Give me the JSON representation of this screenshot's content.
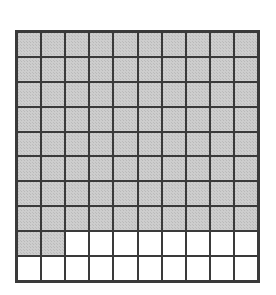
{
  "figure": {
    "description": "A ten by ten square grid with some cells shaded",
    "grid": {
      "rows": 10,
      "columns": 10,
      "total_cells": 100,
      "shaded_cells": 82,
      "unshaded_cells": 18,
      "shaded_fraction": "82/100",
      "shaded_decimal": "0.82",
      "shaded_percent": "82%"
    },
    "colors": {
      "shaded_fill": "#cdcdcd",
      "unshaded_fill": "#ffffff",
      "grid_line": "#3a3a3a",
      "background": "#ffffff"
    }
  },
  "chart_data": {
    "type": "heatmap",
    "xlabel": "",
    "ylabel": "",
    "categories": [
      "1",
      "2",
      "3",
      "4",
      "5",
      "6",
      "7",
      "8",
      "9",
      "10"
    ],
    "row_labels": [
      "1",
      "2",
      "3",
      "4",
      "5",
      "6",
      "7",
      "8",
      "9",
      "10"
    ],
    "legend": [
      "shaded",
      "unshaded"
    ],
    "value_map": {
      "1": "shaded",
      "0": "unshaded"
    },
    "values": [
      [
        1,
        1,
        1,
        1,
        1,
        1,
        1,
        1,
        1,
        1
      ],
      [
        1,
        1,
        1,
        1,
        1,
        1,
        1,
        1,
        1,
        1
      ],
      [
        1,
        1,
        1,
        1,
        1,
        1,
        1,
        1,
        1,
        1
      ],
      [
        1,
        1,
        1,
        1,
        1,
        1,
        1,
        1,
        1,
        1
      ],
      [
        1,
        1,
        1,
        1,
        1,
        1,
        1,
        1,
        1,
        1
      ],
      [
        1,
        1,
        1,
        1,
        1,
        1,
        1,
        1,
        1,
        1
      ],
      [
        1,
        1,
        1,
        1,
        1,
        1,
        1,
        1,
        1,
        1
      ],
      [
        1,
        1,
        1,
        1,
        1,
        1,
        1,
        1,
        1,
        1
      ],
      [
        1,
        1,
        0,
        0,
        0,
        0,
        0,
        0,
        0,
        0
      ],
      [
        0,
        0,
        0,
        0,
        0,
        0,
        0,
        0,
        0,
        0
      ]
    ],
    "row_shaded_counts": [
      10,
      10,
      10,
      10,
      10,
      10,
      10,
      10,
      2,
      0
    ],
    "shaded_total": 82,
    "grid": true,
    "legend_position": "none"
  }
}
